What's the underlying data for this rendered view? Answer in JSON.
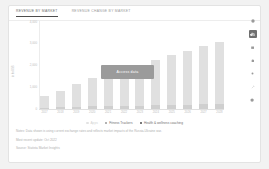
{
  "card": {
    "tabs": [
      {
        "label": "REVENUE BY MARKET",
        "active": true
      },
      {
        "label": "REVENUE CHANGE BY MARKET",
        "active": false
      }
    ],
    "overlay_button": "Access data",
    "notes": [
      "Notes: Data shown is using current exchange rates and reflects market impacts of the Russia-Ukraine war.",
      "Most recent update: Oct 2022",
      "Source: Statista Market Insights"
    ]
  },
  "toolbar": {
    "items": [
      {
        "name": "info-icon",
        "active": false
      },
      {
        "name": "bar-chart-icon",
        "active": true
      },
      {
        "name": "table-icon",
        "active": false
      },
      {
        "name": "settings-icon",
        "active": false
      },
      {
        "name": "share-icon",
        "active": false
      },
      {
        "name": "edit-icon",
        "active": false
      },
      {
        "name": "download-icon",
        "active": false
      }
    ]
  },
  "chart_data": {
    "type": "bar",
    "stacked": true,
    "title": "Revenue by market",
    "xlabel": "",
    "ylabel": "in bn US$",
    "grid": false,
    "legend_position": "bottom",
    "ylim": [
      0,
      4000
    ],
    "yticks": [
      0,
      1000,
      2000,
      3000,
      4000
    ],
    "ytick_labels": [
      "0",
      "1,000",
      "2,000",
      "3,000",
      "4,000"
    ],
    "categories": [
      "2017",
      "2018",
      "2019",
      "2020",
      "2021",
      "2022",
      "2023",
      "2024",
      "2025",
      "2026",
      "2027",
      "2028"
    ],
    "series": [
      {
        "name": "Fitness Trackers",
        "color": "#e0e0e0",
        "values": [
          520,
          760,
          1020,
          1290,
          1660,
          1660,
          1790,
          2060,
          2260,
          2420,
          2630,
          2790
        ]
      },
      {
        "name": "Health & wellness coaching",
        "color": "#cfcfcf",
        "values": [
          60,
          75,
          95,
          115,
          140,
          140,
          155,
          175,
          190,
          205,
          220,
          235
        ]
      }
    ],
    "legend": [
      {
        "label": "Apps",
        "color": "#e2e2e2",
        "muted": true
      },
      {
        "label": "Fitness Trackers",
        "color": "#9a9a9a",
        "muted": false
      },
      {
        "label": "Health & wellness coaching",
        "color": "#4d4d4d",
        "muted": false
      }
    ]
  }
}
